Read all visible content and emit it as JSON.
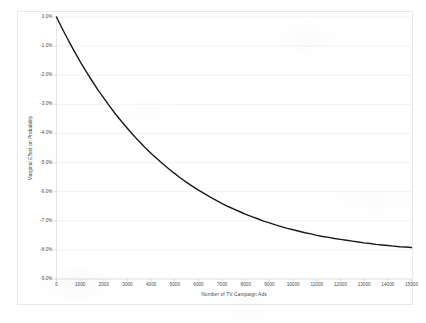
{
  "chart_data": {
    "type": "line",
    "title": "",
    "subtitle": "",
    "xlabel": "Number of TV Campaign Ads",
    "ylabel": "Marginal Effect on Probability",
    "xlim": [
      0,
      15000
    ],
    "ylim": [
      -9.0,
      0.0
    ],
    "grid": "horizontal",
    "legend": "none",
    "x_tick_labels": [
      "0",
      "1000",
      "2000",
      "3000",
      "4000",
      "5000",
      "6000",
      "7000",
      "8000",
      "9000",
      "10000",
      "11000",
      "12000",
      "13000",
      "14000",
      "15000"
    ],
    "x_tick_values": [
      0,
      1000,
      2000,
      3000,
      4000,
      5000,
      6000,
      7000,
      8000,
      9000,
      10000,
      11000,
      12000,
      13000,
      14000,
      15000
    ],
    "y_tick_labels": [
      "0.0%",
      "-1.0%",
      "-2.0%",
      "-3.0%",
      "-4.0%",
      "-5.0%",
      "-6.0%",
      "-7.0%",
      "-8.0%",
      "-9.0%"
    ],
    "y_tick_values": [
      0.0,
      -1.0,
      -2.0,
      -3.0,
      -4.0,
      -5.0,
      -6.0,
      -7.0,
      -8.0,
      -9.0
    ],
    "series": [
      {
        "name": "Marginal Effect",
        "color": "#1a1a1a",
        "line_width": 1.4,
        "x": [
          0,
          250,
          500,
          750,
          1000,
          1250,
          1500,
          1750,
          2000,
          2250,
          2500,
          2750,
          3000,
          3250,
          3500,
          3750,
          4000,
          4250,
          4500,
          4750,
          5000,
          5250,
          5500,
          5750,
          6000,
          6250,
          6500,
          6750,
          7000,
          7250,
          7500,
          7750,
          8000,
          8250,
          8500,
          8750,
          9000,
          9250,
          9500,
          9750,
          10000,
          10250,
          10500,
          10750,
          11000,
          11250,
          11500,
          11750,
          12000,
          12250,
          12500,
          12750,
          13000,
          13250,
          13500,
          13750,
          14000,
          14250,
          14500,
          14750,
          15000
        ],
        "y": [
          0.0,
          -0.41,
          -0.8,
          -1.17,
          -1.53,
          -1.87,
          -2.19,
          -2.5,
          -2.79,
          -3.07,
          -3.34,
          -3.59,
          -3.83,
          -4.06,
          -4.28,
          -4.49,
          -4.69,
          -4.87,
          -5.05,
          -5.22,
          -5.38,
          -5.54,
          -5.68,
          -5.82,
          -5.95,
          -6.07,
          -6.19,
          -6.3,
          -6.41,
          -6.51,
          -6.6,
          -6.69,
          -6.78,
          -6.86,
          -6.93,
          -7.01,
          -7.07,
          -7.14,
          -7.2,
          -7.26,
          -7.31,
          -7.36,
          -7.41,
          -7.45,
          -7.5,
          -7.54,
          -7.57,
          -7.61,
          -7.64,
          -7.67,
          -7.7,
          -7.73,
          -7.76,
          -7.78,
          -7.81,
          -7.83,
          -7.85,
          -7.87,
          -7.89,
          -7.9,
          -7.92
        ]
      }
    ],
    "annotations": []
  }
}
